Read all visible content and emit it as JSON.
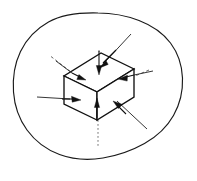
{
  "figure": {
    "kind": "technical-line-diagram",
    "caption_partial": "",
    "background_color": "#ffffff",
    "ink_color": "#111111",
    "outline_color": "#1a1a1a",
    "hidden_edge_color": "#3a3a3a",
    "axis_color": "#4a4a4a",
    "canvas": {
      "width": 197,
      "height": 181
    }
  },
  "body_outline": {
    "name": "irregular-body-boundary",
    "style": "solid",
    "closed": true,
    "points": [
      [
        98,
        13
      ],
      [
        114,
        14
      ],
      [
        131,
        18
      ],
      [
        147,
        25
      ],
      [
        160,
        34
      ],
      [
        170,
        45
      ],
      [
        177,
        58
      ],
      [
        181,
        72
      ],
      [
        182,
        86
      ],
      [
        180,
        100
      ],
      [
        175,
        113
      ],
      [
        167,
        125
      ],
      [
        156,
        136
      ],
      [
        143,
        145
      ],
      [
        128,
        152
      ],
      [
        112,
        157
      ],
      [
        96,
        159
      ],
      [
        80,
        158
      ],
      [
        64,
        154
      ],
      [
        50,
        147
      ],
      [
        38,
        138
      ],
      [
        28,
        127
      ],
      [
        20,
        114
      ],
      [
        15,
        100
      ],
      [
        13,
        86
      ],
      [
        14,
        72
      ],
      [
        18,
        58
      ],
      [
        25,
        45
      ],
      [
        34,
        34
      ],
      [
        46,
        25
      ],
      [
        60,
        18
      ],
      [
        76,
        14
      ],
      [
        98,
        13
      ]
    ]
  },
  "volume_element": {
    "name": "cuboid-volume-element",
    "shape": "cuboid",
    "projection": "isometric",
    "vertices": {
      "top_back": [
        101,
        53
      ],
      "top_left": [
        64,
        76
      ],
      "top_front": [
        97,
        92
      ],
      "top_right": [
        134,
        69
      ],
      "bottom_left": [
        64,
        104
      ],
      "bottom_front": [
        97,
        120
      ],
      "bottom_right": [
        134,
        97
      ],
      "bottom_back": [
        101,
        81
      ]
    },
    "visible_faces": [
      "top",
      "left-front",
      "right-front"
    ],
    "hidden_edges": [
      "back-vertical",
      "back-top-left",
      "back-top-right"
    ]
  },
  "axes": {
    "name": "reference-axes",
    "style": "dashed",
    "lines": [
      {
        "name": "axis-left-dashed",
        "from": [
          52,
          57
        ],
        "to": [
          97,
          92
        ]
      },
      {
        "name": "axis-right-dashed",
        "from": [
          148,
          70
        ],
        "to": [
          97,
          92
        ]
      },
      {
        "name": "axis-vertical-dotted",
        "from": [
          97,
          44
        ],
        "to": [
          97,
          145
        ]
      }
    ]
  },
  "force_arrows": [
    {
      "name": "arrow-top-face-down",
      "face": "top",
      "direction": "inward",
      "tip": [
        97,
        74
      ],
      "tail": [
        97,
        50
      ]
    },
    {
      "name": "arrow-top-face-diagonal",
      "face": "top",
      "direction": "inward",
      "tip": [
        99,
        69
      ],
      "tail": [
        129,
        36
      ]
    },
    {
      "name": "arrow-top-left-inward",
      "face": "top",
      "direction": "inward",
      "tip": [
        80,
        76
      ],
      "tail": [
        56,
        62
      ]
    },
    {
      "name": "arrow-left-face-inward",
      "face": "left-front",
      "direction": "inward",
      "tip": [
        79,
        100
      ],
      "tail": [
        38,
        97
      ]
    },
    {
      "name": "arrow-right-face-inward",
      "face": "right-front",
      "direction": "inward",
      "tip": [
        119,
        79
      ],
      "tail": [
        152,
        72
      ]
    },
    {
      "name": "arrow-right-lower-inward",
      "face": "right-front",
      "direction": "inward",
      "tip": [
        113,
        104
      ],
      "tail": [
        140,
        122
      ]
    },
    {
      "name": "arrow-bottom-face-up",
      "face": "bottom",
      "direction": "inward",
      "tip": [
        97,
        100
      ],
      "tail": [
        97,
        117
      ]
    }
  ],
  "leader_lines": [
    {
      "name": "leader-top-right",
      "from": [
        129,
        36
      ],
      "to": [
        113,
        53
      ]
    },
    {
      "name": "leader-left",
      "from": [
        38,
        97
      ],
      "to": [
        68,
        98
      ]
    },
    {
      "name": "leader-lower-right",
      "from": [
        146,
        128
      ],
      "to": [
        116,
        102
      ]
    },
    {
      "name": "leader-right",
      "from": [
        152,
        72
      ],
      "to": [
        134,
        75
      ]
    }
  ],
  "legend": {
    "arrow_meaning": "inward-normal force on face",
    "dashed_meaning": "hidden edge / reference axis"
  }
}
